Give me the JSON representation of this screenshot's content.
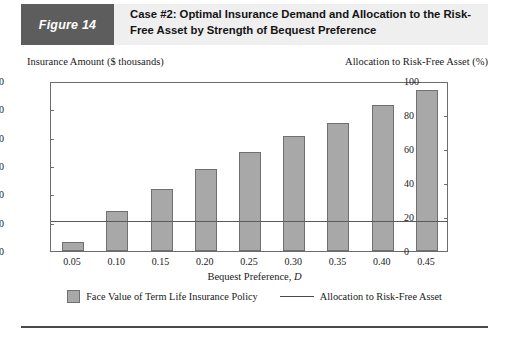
{
  "figure": {
    "tag": "Figure 14",
    "title": "Case #2: Optimal Insurance Demand and Allocation to the Risk-Free Asset by Strength of Bequest Preference"
  },
  "axis_captions": {
    "left": "Insurance Amount ($ thousands)",
    "right": "Allocation to Risk-Free Asset (%)"
  },
  "colors": {
    "tag_background": "#5d5d5d",
    "header_band": "#efefef",
    "bar_fill": "#a8a8a8",
    "bar_stroke": "#707070",
    "line": "#5a5a5a",
    "axis": "#6d6d6d"
  },
  "chart_data": {
    "type": "bar",
    "title": "Case #2: Optimal Insurance Demand and Allocation to the Risk-Free Asset by Strength of Bequest Preference",
    "xlabel": "Bequest Preference, D",
    "ylabel": "Insurance Amount ($ thousands)",
    "y2label": "Allocation to Risk-Free Asset (%)",
    "categories": [
      "0.05",
      "0.10",
      "0.15",
      "0.20",
      "0.25",
      "0.30",
      "0.35",
      "0.40",
      "0.45"
    ],
    "ylim": [
      0,
      600
    ],
    "y2lim": [
      0,
      100
    ],
    "yticks": [
      "0",
      "100",
      "200",
      "300",
      "400",
      "500",
      "600"
    ],
    "y2ticks": [
      "0",
      "20",
      "40",
      "60",
      "80",
      "100"
    ],
    "grid": false,
    "legend_position": "bottom",
    "series": [
      {
        "name": "Face Value of Term Life Insurance Policy",
        "type": "bar",
        "axis": "left",
        "values": [
          32,
          140,
          218,
          290,
          350,
          405,
          452,
          515,
          570
        ]
      },
      {
        "name": "Allocation to Risk-Free Asset",
        "type": "line",
        "axis": "right",
        "values": [
          17,
          17,
          17,
          17,
          17,
          17,
          17,
          17,
          17
        ]
      }
    ]
  },
  "legend": {
    "bar_label": "Face Value of Term Life Insurance Policy",
    "line_label": "Allocation to Risk-Free Asset"
  }
}
